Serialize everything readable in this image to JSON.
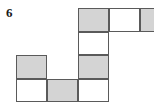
{
  "figure": {
    "item_number": "6",
    "colors": {
      "shaded": "#d4d4d4",
      "white": "#ffffff",
      "border": "#5a5a5a",
      "label": "#1a1a1a",
      "background": "#ffffff"
    },
    "grid": {
      "origin_x": 16,
      "origin_y": 8,
      "cell_width": 31,
      "cell_height": 23.5,
      "columns": 4,
      "rows": 4
    },
    "cells": [
      {
        "name": "cell-r1c3",
        "row": 1,
        "col": 3,
        "fill": "shaded"
      },
      {
        "name": "cell-r1c4",
        "row": 1,
        "col": 4,
        "fill": "white"
      },
      {
        "name": "cell-r1c5",
        "row": 1,
        "col": 5,
        "fill": "shaded"
      },
      {
        "name": "cell-r2c3",
        "row": 2,
        "col": 3,
        "fill": "white"
      },
      {
        "name": "cell-r3c1",
        "row": 3,
        "col": 1,
        "fill": "shaded"
      },
      {
        "name": "cell-r3c3",
        "row": 3,
        "col": 3,
        "fill": "shaded"
      },
      {
        "name": "cell-r4c1",
        "row": 4,
        "col": 1,
        "fill": "white"
      },
      {
        "name": "cell-r4c2",
        "row": 4,
        "col": 2,
        "fill": "shaded"
      },
      {
        "name": "cell-r4c3",
        "row": 4,
        "col": 3,
        "fill": "white"
      }
    ],
    "counts": {
      "total_cells": "9",
      "shaded_cells": "5",
      "white_cells": "4"
    }
  }
}
